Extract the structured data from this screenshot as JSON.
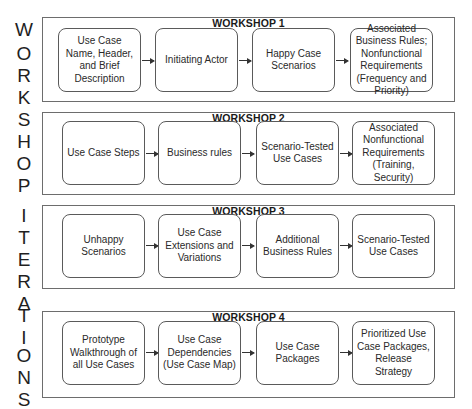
{
  "side_label": {
    "letters": [
      "W",
      "O",
      "R",
      "K",
      "S",
      "H",
      "O",
      "P",
      "I",
      "T",
      "E",
      "R",
      "A",
      "T",
      "I",
      "O",
      "N",
      "S"
    ],
    "text": "WORKSHOP ITERATIONS"
  },
  "workshops": [
    {
      "title": "WORKSHOP 1",
      "steps": [
        "Use Case Name, Header, and Brief Description",
        "Initiating Actor",
        "Happy Case Scenarios",
        "Associated Business Rules; Nonfunctional Requirements (Frequency and Priority)"
      ]
    },
    {
      "title": "WORKSHOP 2",
      "steps": [
        "Use Case Steps",
        "Business rules",
        "Scenario-Tested Use Cases",
        "Associated Nonfunctional Requirements (Training, Security)"
      ]
    },
    {
      "title": "WORKSHOP 3",
      "steps": [
        "Unhappy Scenarios",
        "Use Case Extensions and Variations",
        "Additional Business Rules",
        "Scenario-Tested Use Cases"
      ]
    },
    {
      "title": "WORKSHOP 4",
      "steps": [
        "Prototype Walkthrough of all Use Cases",
        "Use Case Dependencies (Use Case Map)",
        "Use Case Packages",
        "Prioritized Use Case Packages, Release Strategy"
      ]
    }
  ]
}
